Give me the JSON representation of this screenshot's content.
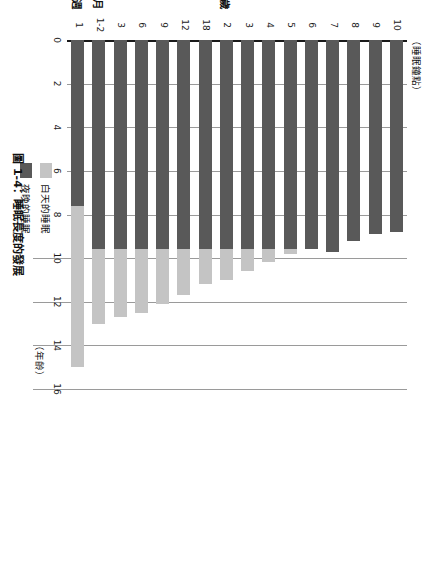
{
  "figure": {
    "caption": "圖 1-4：睡眠長度的發展",
    "value_axis_caption": "（睡眠鐘點）",
    "category_axis_caption": "（年齡）"
  },
  "legend": {
    "position": "inside-upper-right",
    "items": [
      {
        "label": "白天的睡眠",
        "color": "#c4c4c4",
        "key": "day"
      },
      {
        "label": "夜晚的睡眠",
        "color": "#595959",
        "key": "night"
      }
    ]
  },
  "group_labels": [
    {
      "text": "週",
      "category": "1"
    },
    {
      "text": "月",
      "category": "1-2"
    },
    {
      "text": "歲",
      "category": "2"
    }
  ],
  "chart_data": {
    "type": "bar",
    "orientation": "horizontal-stacked",
    "title": "圖 1-4：睡眠長度的發展",
    "xlabel": "（睡眠鐘點）",
    "ylabel": "（年齡）",
    "xlim": [
      0,
      16
    ],
    "xticks": [
      0,
      2,
      4,
      6,
      8,
      10,
      12,
      14,
      16
    ],
    "xticklabels": [
      "0",
      "2",
      "4",
      "6",
      "8",
      "10",
      "12",
      "14",
      "16"
    ],
    "grid": true,
    "categories": [
      "1",
      "1-2",
      "3",
      "6",
      "9",
      "12",
      "18",
      "2",
      "3",
      "4",
      "5",
      "6",
      "7",
      "8",
      "9",
      "10"
    ],
    "category_units": [
      "週",
      "月",
      "月",
      "月",
      "月",
      "月",
      "月",
      "歲",
      "歲",
      "歲",
      "歲",
      "歲",
      "歲",
      "歲",
      "歲",
      "歲"
    ],
    "series": [
      {
        "name": "夜晚的睡眠",
        "color": "#595959",
        "values": [
          7.6,
          9.6,
          9.6,
          9.6,
          9.6,
          9.6,
          9.6,
          9.6,
          9.6,
          9.6,
          9.6,
          9.6,
          9.7,
          9.2,
          8.9,
          8.8
        ]
      },
      {
        "name": "白天的睡眠",
        "color": "#c4c4c4",
        "values": [
          7.4,
          3.4,
          3.1,
          2.9,
          2.5,
          2.1,
          1.6,
          1.4,
          1.0,
          0.6,
          0.2,
          0.0,
          0.0,
          0.0,
          0.0,
          0.0
        ]
      }
    ],
    "totals": [
      15.0,
      13.0,
      12.7,
      12.5,
      12.1,
      11.7,
      11.2,
      11.0,
      10.6,
      10.2,
      9.8,
      9.6,
      9.7,
      9.2,
      8.9,
      8.8
    ]
  }
}
